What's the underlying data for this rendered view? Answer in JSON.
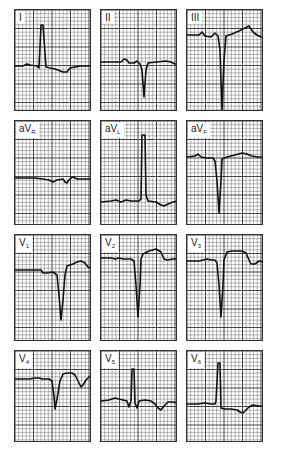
{
  "figure": {
    "grid": {
      "minor_px": 3.7,
      "major_every": 5,
      "line_color": "#333333"
    },
    "trace_color": "#111111",
    "leads": [
      {
        "id": "I",
        "label": "I",
        "sub": "",
        "x": 14,
        "y": 9,
        "h": 102,
        "points": "0,56 8,56 12,54 15,55 22,56 24,58 26,15 28,15 31,57 40,59 48,62 52,62 55,58 60,57 66,56 77,56"
      },
      {
        "id": "II",
        "label": "II",
        "sub": "",
        "x": 100,
        "y": 9,
        "h": 102,
        "points": "0,52 20,52 23,49 26,50 28,53 33,53 36,51 39,54 41,60 43,87 45,60 47,53 55,52 65,51 70,52 74,54 77,54"
      },
      {
        "id": "III",
        "label": "III",
        "sub": "",
        "x": 186,
        "y": 9,
        "h": 102,
        "points": "0,25 12,25 15,22 18,26 24,27 28,23 31,26 33,40 35,100 37,50 39,26 45,24 52,21 58,18 62,16 66,22 70,25 74,27 77,27"
      },
      {
        "id": "aVR",
        "label": "aV",
        "sub": "R",
        "x": 14,
        "y": 120,
        "h": 105,
        "points": "0,57 20,57 28,58 34,59 38,61 42,59 48,58 50,61 52,62 54,59 56,57 58,56 62,58 70,58 77,58"
      },
      {
        "id": "aVL",
        "label": "aV",
        "sub": "L",
        "x": 100,
        "y": 120,
        "h": 105,
        "points": "0,81 10,80 15,79 20,81 25,79 30,80 38,80 40,78 41,14 44,14 45,74 47,80 55,81 60,84 63,85 67,83 72,81 77,80"
      },
      {
        "id": "aVF",
        "label": "aV",
        "sub": "F",
        "x": 186,
        "y": 120,
        "h": 105,
        "points": "0,36 8,35 11,33 14,36 20,37 26,37 28,40 30,60 32,92 34,60 35,38 40,36 48,34 55,32 60,33 65,35 71,36 77,36"
      },
      {
        "id": "V1",
        "label": "V",
        "sub": "1",
        "x": 14,
        "y": 234,
        "h": 107,
        "points": "0,35 20,35 26,35 28,38 32,38 38,37 42,40 44,60 46,85 48,65 50,40 52,31 58,29 62,27 66,26 70,28 73,32 77,34"
      },
      {
        "id": "V2",
        "label": "V",
        "sub": "2",
        "x": 100,
        "y": 234,
        "h": 107,
        "points": "0,23 10,23 14,24 18,23 22,24 30,24 33,26 35,50 37,82 39,50 40,24 42,19 48,16 55,14 60,17 63,24 66,25 72,24 77,24"
      },
      {
        "id": "V3",
        "label": "V",
        "sub": "3",
        "x": 186,
        "y": 234,
        "h": 107,
        "points": "0,26 12,26 16,25 20,24 24,25 28,25 30,28 32,50 34,82 36,50 37,25 40,17 45,16 55,16 59,18 62,25 64,29 68,29 72,26 77,27"
      },
      {
        "id": "V4",
        "label": "V",
        "sub": "4",
        "x": 14,
        "y": 350,
        "h": 92,
        "points": "0,28 15,28 20,27 24,27 27,28 30,28 34,28 37,30 39,45 40,58 42,48 45,30 48,23 52,22 57,22 60,24 63,30 66,36 68,34 71,29 74,26 77,24"
      },
      {
        "id": "V5",
        "label": "V",
        "sub": "5",
        "x": 100,
        "y": 350,
        "h": 92,
        "points": "0,50 8,49 14,47 18,48 22,49 26,50 28,56 30,50 31,18 33,18 34,52 36,57 38,50 44,49 50,50 54,53 57,57 60,59 63,55 67,51 72,51 77,52"
      },
      {
        "id": "V6",
        "label": "V",
        "sub": "6",
        "x": 186,
        "y": 350,
        "h": 92,
        "points": "0,53 10,53 18,52 24,53 28,53 29,50 31,12 33,12 34,57 38,58 44,58 50,59 53,61 56,62 59,59 62,56 66,54 72,55 77,55"
      }
    ]
  }
}
